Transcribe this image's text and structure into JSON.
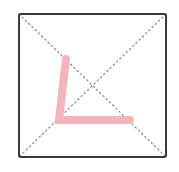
{
  "diagram": {
    "background": "#ffffff",
    "frame": {
      "x": 19,
      "y": 14,
      "width": 147,
      "height": 143,
      "stroke": "#3a3a3a",
      "stroke_width": 2,
      "corner_radius": 2
    },
    "diagonals": {
      "stroke": "#8a8a8a",
      "stroke_width": 1.2,
      "dash": "1.5 3",
      "lines": [
        {
          "x1": 19,
          "y1": 14,
          "x2": 166,
          "y2": 157
        },
        {
          "x1": 166,
          "y1": 14,
          "x2": 19,
          "y2": 157
        }
      ]
    },
    "stroke_path": {
      "color": "#f4b3bd",
      "width": 8,
      "points": [
        {
          "x": 66,
          "y": 59
        },
        {
          "x": 59,
          "y": 120
        },
        {
          "x": 130,
          "y": 120
        }
      ]
    }
  }
}
